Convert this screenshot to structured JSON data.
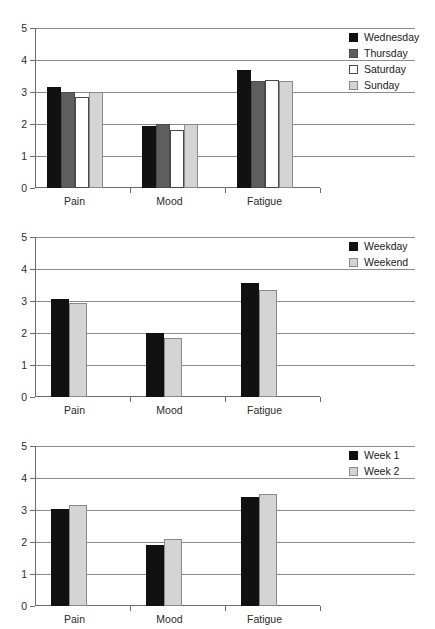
{
  "page": {
    "background": "#ffffff",
    "width": 435,
    "height": 624
  },
  "palette": {
    "black": "#111111",
    "dark_gray": "#5e5e5e",
    "white": "#ffffff",
    "light_gray": "#d4d4d4",
    "gridline": "#8c8c8c",
    "axis": "#6b6b6b",
    "text": "#1a1a1a"
  },
  "charts": [
    {
      "id": "chart-days",
      "legend_position": "right",
      "legend": [
        {
          "label": "Wednesday",
          "swatch": "sw-black"
        },
        {
          "label": "Thursday",
          "swatch": "sw-darkgray"
        },
        {
          "label": "Saturday",
          "swatch": "sw-white"
        },
        {
          "label": "Sunday",
          "swatch": "sw-lightgray"
        }
      ],
      "yticks": [
        "0",
        "1",
        "2",
        "3",
        "4",
        "5"
      ],
      "categories": [
        "Pain",
        "Mood",
        "Fatigue"
      ]
    },
    {
      "id": "chart-weekday-weekend",
      "legend_position": "right",
      "legend": [
        {
          "label": "Weekday",
          "swatch": "sw-black"
        },
        {
          "label": "Weekend",
          "swatch": "sw-lightgray"
        }
      ],
      "yticks": [
        "0",
        "1",
        "2",
        "3",
        "4",
        "5"
      ],
      "categories": [
        "Pain",
        "Mood",
        "Fatigue"
      ]
    },
    {
      "id": "chart-week1-week2",
      "legend_position": "right",
      "legend": [
        {
          "label": "Week 1",
          "swatch": "sw-black"
        },
        {
          "label": "Week 2",
          "swatch": "sw-lightgray"
        }
      ],
      "yticks": [
        "0",
        "1",
        "2",
        "3",
        "4",
        "5"
      ],
      "categories": [
        "Pain",
        "Mood",
        "Fatigue"
      ]
    }
  ],
  "chart_data": [
    {
      "type": "bar",
      "title": "",
      "xlabel": "",
      "ylabel": "",
      "ylim": [
        0,
        5
      ],
      "yticks": [
        0,
        1,
        2,
        3,
        4,
        5
      ],
      "grid": true,
      "legend": "right",
      "categories": [
        "Pain",
        "Mood",
        "Fatigue"
      ],
      "series": [
        {
          "name": "Wednesday",
          "color": "#111111",
          "values": [
            3.15,
            1.95,
            3.7
          ]
        },
        {
          "name": "Thursday",
          "color": "#5e5e5e",
          "values": [
            3.0,
            2.0,
            3.35
          ]
        },
        {
          "name": "Saturday",
          "color": "#ffffff",
          "values": [
            2.85,
            1.8,
            3.38
          ]
        },
        {
          "name": "Sunday",
          "color": "#d4d4d4",
          "values": [
            3.0,
            2.0,
            3.33
          ]
        }
      ]
    },
    {
      "type": "bar",
      "title": "",
      "xlabel": "",
      "ylabel": "",
      "ylim": [
        0,
        5
      ],
      "yticks": [
        0,
        1,
        2,
        3,
        4,
        5
      ],
      "grid": true,
      "legend": "right",
      "categories": [
        "Pain",
        "Mood",
        "Fatigue"
      ],
      "series": [
        {
          "name": "Weekday",
          "color": "#111111",
          "values": [
            3.05,
            2.0,
            3.55
          ]
        },
        {
          "name": "Weekend",
          "color": "#d4d4d4",
          "values": [
            2.95,
            1.85,
            3.35
          ]
        }
      ]
    },
    {
      "type": "bar",
      "title": "",
      "xlabel": "",
      "ylabel": "",
      "ylim": [
        0,
        5
      ],
      "yticks": [
        0,
        1,
        2,
        3,
        4,
        5
      ],
      "grid": true,
      "legend": "right",
      "categories": [
        "Pain",
        "Mood",
        "Fatigue"
      ],
      "series": [
        {
          "name": "Week 1",
          "color": "#111111",
          "values": [
            3.02,
            1.9,
            3.4
          ]
        },
        {
          "name": "Week 2",
          "color": "#d4d4d4",
          "values": [
            3.17,
            2.1,
            3.5
          ]
        }
      ]
    }
  ]
}
